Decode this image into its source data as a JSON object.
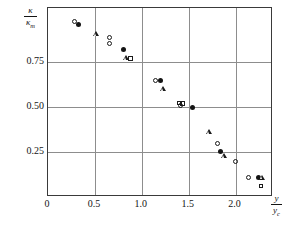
{
  "chart_data": {
    "type": "scatter",
    "title": "",
    "subtitle": "",
    "xlabel_numerator": "y",
    "xlabel_denominator": "y",
    "xlabel_denominator_sub": "c",
    "ylabel_numerator": "κ",
    "ylabel_denominator": "κ",
    "ylabel_denominator_sub": "m",
    "xlim": [
      0,
      2.4
    ],
    "ylim": [
      0,
      1.05
    ],
    "grid": true,
    "grid_axes": "both",
    "legend": "none",
    "xticks": [
      0,
      0.5,
      1.0,
      1.5,
      2.0
    ],
    "xtick_labels": [
      "0",
      "0.5",
      "1.0",
      "1.5",
      "2.0"
    ],
    "yticks": [
      0.25,
      0.5,
      0.75
    ],
    "ytick_labels": [
      "0.25",
      "0.50",
      "0.75"
    ],
    "series": [
      {
        "name": "open-circle",
        "marker": "open-circle",
        "points": [
          {
            "x": 0.285,
            "y": 0.975
          },
          {
            "x": 0.655,
            "y": 0.885
          },
          {
            "x": 0.655,
            "y": 0.855
          },
          {
            "x": 1.145,
            "y": 0.65
          },
          {
            "x": 1.415,
            "y": 0.508
          },
          {
            "x": 1.805,
            "y": 0.3
          },
          {
            "x": 1.995,
            "y": 0.2
          },
          {
            "x": 2.135,
            "y": 0.108
          }
        ]
      },
      {
        "name": "filled-circle",
        "marker": "filled-circle",
        "points": [
          {
            "x": 0.325,
            "y": 0.96
          },
          {
            "x": 0.805,
            "y": 0.82
          },
          {
            "x": 1.195,
            "y": 0.648
          },
          {
            "x": 1.54,
            "y": 0.5
          },
          {
            "x": 1.835,
            "y": 0.253
          },
          {
            "x": 2.25,
            "y": 0.11
          }
        ]
      },
      {
        "name": "triangle",
        "marker": "open-triangle",
        "points": [
          {
            "x": 0.515,
            "y": 0.905
          },
          {
            "x": 0.83,
            "y": 0.772
          },
          {
            "x": 1.225,
            "y": 0.602
          },
          {
            "x": 1.715,
            "y": 0.36
          },
          {
            "x": 1.88,
            "y": 0.228
          },
          {
            "x": 2.285,
            "y": 0.108
          }
        ]
      },
      {
        "name": "square",
        "marker": "open-square",
        "points": [
          {
            "x": 0.88,
            "y": 0.768
          },
          {
            "x": 1.4,
            "y": 0.523
          },
          {
            "x": 1.435,
            "y": 0.518
          },
          {
            "x": 2.27,
            "y": 0.062
          }
        ]
      }
    ]
  }
}
